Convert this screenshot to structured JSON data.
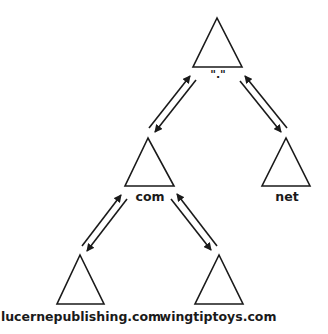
{
  "diagram": {
    "colors": {
      "stroke": "#1a1a1a",
      "background": "#ffffff"
    },
    "nodes": [
      {
        "id": "root",
        "label": "\".\"",
        "apex": [
          217,
          18
        ],
        "base_left": [
          193,
          67
        ],
        "base_right": [
          242,
          67
        ],
        "label_pos": [
          218,
          78
        ]
      },
      {
        "id": "com",
        "label": "com",
        "apex": [
          148,
          138
        ],
        "base_left": [
          125,
          186
        ],
        "base_right": [
          174,
          186
        ],
        "label_pos": [
          150,
          201
        ]
      },
      {
        "id": "net",
        "label": "net",
        "apex": [
          286,
          138
        ],
        "base_left": [
          262,
          186
        ],
        "base_right": [
          310,
          186
        ],
        "label_pos": [
          287,
          201
        ]
      },
      {
        "id": "lucernepublishing",
        "label": "lucernepublishing.com",
        "apex": [
          80,
          255
        ],
        "base_left": [
          57,
          304
        ],
        "base_right": [
          104,
          304
        ],
        "label_pos": [
          81,
          321
        ]
      },
      {
        "id": "wingtiptoys",
        "label": "wingtiptoys.com",
        "apex": [
          219,
          255
        ],
        "base_left": [
          195,
          304
        ],
        "base_right": [
          243,
          304
        ],
        "label_pos": [
          218,
          321
        ]
      }
    ],
    "edges": [
      {
        "from": "com",
        "to": "root",
        "arrows": [
          {
            "x1": 149,
            "y1": 128,
            "x2": 190,
            "y2": 76
          },
          {
            "x1": 196,
            "y1": 80,
            "x2": 155,
            "y2": 132
          }
        ]
      },
      {
        "from": "net",
        "to": "root",
        "arrows": [
          {
            "x1": 240,
            "y1": 81,
            "x2": 281,
            "y2": 132
          },
          {
            "x1": 287,
            "y1": 128,
            "x2": 245,
            "y2": 76
          }
        ]
      },
      {
        "from": "lucernepublishing",
        "to": "com",
        "arrows": [
          {
            "x1": 82,
            "y1": 246,
            "x2": 121,
            "y2": 195
          },
          {
            "x1": 127,
            "y1": 199,
            "x2": 87,
            "y2": 251
          }
        ]
      },
      {
        "from": "wingtiptoys",
        "to": "com",
        "arrows": [
          {
            "x1": 171,
            "y1": 199,
            "x2": 211,
            "y2": 250
          },
          {
            "x1": 217,
            "y1": 246,
            "x2": 177,
            "y2": 194
          }
        ]
      }
    ]
  }
}
